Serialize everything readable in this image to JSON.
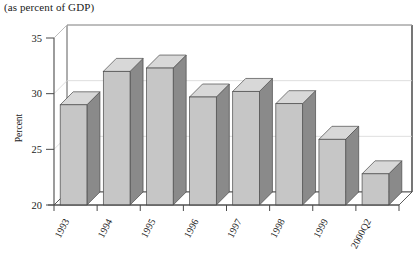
{
  "figure": {
    "title": "(as percent of GDP)"
  },
  "chart_data": {
    "type": "bar",
    "title": "(as percent of GDP)",
    "xlabel": "",
    "ylabel": "Percent",
    "categories": [
      "1993",
      "1994",
      "1995",
      "1996",
      "1997",
      "1998",
      "1999",
      "2000Q2"
    ],
    "values": [
      29.0,
      32.0,
      32.3,
      29.7,
      30.2,
      29.1,
      25.9,
      22.8
    ],
    "ylim": [
      20,
      35
    ],
    "yticks": [
      20,
      25,
      30,
      35
    ],
    "ytick_labels": [
      "20",
      "25",
      "30",
      "35"
    ],
    "grid": true,
    "legend": null,
    "style": "3d-column",
    "colors": {
      "bar_front": "#c6c6c6",
      "bar_top": "#d8d8d8",
      "bar_side": "#8a8a8a",
      "axis": "#4a4a4a",
      "grid": "#d5d5d5",
      "floor": "#ffffff",
      "text": "#1a1a1a"
    }
  }
}
